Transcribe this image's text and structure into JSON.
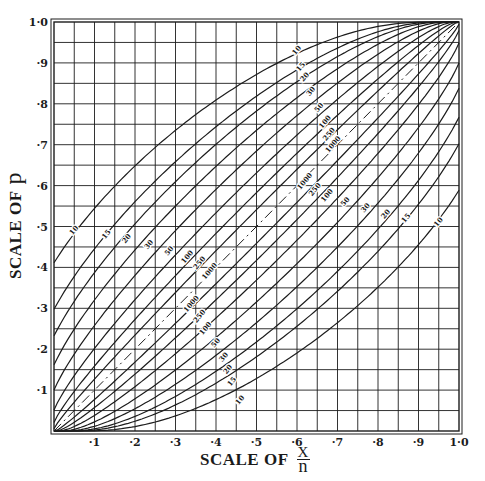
{
  "chart_data": {
    "type": "line",
    "title": "",
    "xlabel": "SCALE OF x/n",
    "ylabel": "SCALE OF p",
    "xlabel_parts": {
      "prefix": "SCALE OF",
      "numerator": "X",
      "denominator": "n"
    },
    "ylabel_parts": {
      "prefix": "SCALE OF",
      "symbol": "p"
    },
    "xlim": [
      0,
      1
    ],
    "ylim": [
      0,
      1
    ],
    "x_ticks": [
      "·1",
      "·2",
      "·3",
      "·4",
      "·5",
      "·6",
      "·7",
      "·8",
      "·9",
      "1·0"
    ],
    "y_ticks": [
      "·1",
      "·2",
      "·3",
      "·4",
      "·5",
      "·6",
      "·7",
      "·8",
      "·9",
      "1·0"
    ],
    "grid": {
      "on": true,
      "step": 0.05
    },
    "confidence_level": 0.99,
    "sample_sizes": [
      10,
      15,
      20,
      30,
      50,
      100,
      250,
      1000
    ],
    "curve_labels": [
      "10",
      "15",
      "20",
      "30",
      "50",
      "100",
      "250",
      "1000"
    ],
    "diagonal": {
      "style": "dash-dot",
      "from": [
        0,
        0
      ],
      "to": [
        1,
        1
      ]
    },
    "series": [
      {
        "name": "n=10 upper",
        "x": [
          0,
          0.5,
          1
        ],
        "y": [
          0.411,
          0.881,
          1
        ]
      },
      {
        "name": "n=10 lower",
        "x": [
          0,
          0.5,
          1
        ],
        "y": [
          0,
          0.119,
          0.589
        ]
      },
      {
        "name": "n=15 upper",
        "x": [
          0,
          0.5,
          1
        ],
        "y": [
          0.298,
          0.83,
          1
        ]
      },
      {
        "name": "n=15 lower",
        "x": [
          0,
          0.5,
          1
        ],
        "y": [
          0,
          0.17,
          0.702
        ]
      },
      {
        "name": "n=20 upper",
        "x": [
          0,
          0.5,
          1
        ],
        "y": [
          0.233,
          0.789,
          1
        ]
      },
      {
        "name": "n=20 lower",
        "x": [
          0,
          0.5,
          1
        ],
        "y": [
          0,
          0.211,
          0.767
        ]
      },
      {
        "name": "n=30 upper",
        "x": [
          0,
          0.5,
          1
        ],
        "y": [
          0.162,
          0.738,
          1
        ]
      },
      {
        "name": "n=30 lower",
        "x": [
          0,
          0.5,
          1
        ],
        "y": [
          0,
          0.262,
          0.838
        ]
      },
      {
        "name": "n=50 upper",
        "x": [
          0,
          0.5,
          1
        ],
        "y": [
          0.1,
          0.686,
          1
        ]
      },
      {
        "name": "n=50 lower",
        "x": [
          0,
          0.5,
          1
        ],
        "y": [
          0,
          0.314,
          0.9
        ]
      },
      {
        "name": "n=100 upper",
        "x": [
          0,
          0.5,
          1
        ],
        "y": [
          0.052,
          0.631,
          1
        ]
      },
      {
        "name": "n=100 lower",
        "x": [
          0,
          0.5,
          1
        ],
        "y": [
          0,
          0.369,
          0.948
        ]
      },
      {
        "name": "n=250 upper",
        "x": [
          0,
          0.5,
          1
        ],
        "y": [
          0.021,
          0.582,
          1
        ]
      },
      {
        "name": "n=250 lower",
        "x": [
          0,
          0.5,
          1
        ],
        "y": [
          0,
          0.418,
          0.979
        ]
      },
      {
        "name": "n=1000 upper",
        "x": [
          0,
          0.5,
          1
        ],
        "y": [
          0.005,
          0.541,
          1
        ]
      },
      {
        "name": "n=1000 lower",
        "x": [
          0,
          0.5,
          1
        ],
        "y": [
          0,
          0.459,
          0.995
        ]
      }
    ],
    "upper_label_positions": [
      {
        "label": "10",
        "x": 0.05,
        "y": 0.49
      },
      {
        "label": "15",
        "x": 0.13,
        "y": 0.48
      },
      {
        "label": "20",
        "x": 0.18,
        "y": 0.47
      },
      {
        "label": "30",
        "x": 0.235,
        "y": 0.455
      },
      {
        "label": "50",
        "x": 0.285,
        "y": 0.44
      },
      {
        "label": "100",
        "x": 0.33,
        "y": 0.425
      },
      {
        "label": "250",
        "x": 0.36,
        "y": 0.41
      },
      {
        "label": "1000",
        "x": 0.385,
        "y": 0.39
      }
    ],
    "lower_label_positions": [
      {
        "label": "1000",
        "x": 0.62,
        "y": 0.61
      },
      {
        "label": "250",
        "x": 0.645,
        "y": 0.59
      },
      {
        "label": "100",
        "x": 0.675,
        "y": 0.575
      },
      {
        "label": "50",
        "x": 0.72,
        "y": 0.56
      },
      {
        "label": "30",
        "x": 0.77,
        "y": 0.545
      },
      {
        "label": "20",
        "x": 0.82,
        "y": 0.53
      },
      {
        "label": "15",
        "x": 0.87,
        "y": 0.52
      },
      {
        "label": "10",
        "x": 0.95,
        "y": 0.51
      }
    ],
    "upper_label_positions_top": [
      {
        "label": "10",
        "x": 0.6,
        "y": 0.93
      },
      {
        "label": "15",
        "x": 0.61,
        "y": 0.89
      },
      {
        "label": "20",
        "x": 0.62,
        "y": 0.865
      },
      {
        "label": "30",
        "x": 0.635,
        "y": 0.83
      },
      {
        "label": "50",
        "x": 0.655,
        "y": 0.79
      },
      {
        "label": "100",
        "x": 0.67,
        "y": 0.755
      },
      {
        "label": "250",
        "x": 0.68,
        "y": 0.725
      },
      {
        "label": "1000",
        "x": 0.69,
        "y": 0.7
      }
    ],
    "lower_label_positions_bottom": [
      {
        "label": "1000",
        "x": 0.34,
        "y": 0.31
      },
      {
        "label": "250",
        "x": 0.36,
        "y": 0.28
      },
      {
        "label": "100",
        "x": 0.375,
        "y": 0.25
      },
      {
        "label": "50",
        "x": 0.4,
        "y": 0.215
      },
      {
        "label": "30",
        "x": 0.42,
        "y": 0.18
      },
      {
        "label": "20",
        "x": 0.43,
        "y": 0.15
      },
      {
        "label": "15",
        "x": 0.44,
        "y": 0.12
      },
      {
        "label": "10",
        "x": 0.46,
        "y": 0.075
      }
    ]
  },
  "axes": {
    "x_title_prefix": "SCALE OF",
    "x_title_num": "X",
    "x_title_den": "n",
    "y_title_prefix": "SCALE OF",
    "y_title_symbol": "p"
  }
}
